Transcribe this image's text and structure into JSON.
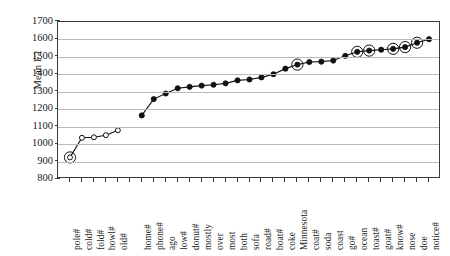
{
  "chart_data": {
    "type": "line",
    "title": "",
    "xlabel": "",
    "ylabel": "Mean F2",
    "ylim": [
      800,
      1700
    ],
    "ytick_labels": [
      "1700",
      "1600",
      "1500",
      "1400",
      "1300",
      "1200",
      "1100",
      "1000",
      "900",
      "800"
    ],
    "ytick_values": [
      1700,
      1600,
      1500,
      1400,
      1300,
      1200,
      1100,
      1000,
      900,
      800
    ],
    "grid": true,
    "legend": "none",
    "categories": [
      "pole#",
      "cold#",
      "fold#",
      "bowl#",
      "old#",
      "",
      "home#",
      "phone#",
      "ago",
      "low#",
      "donut#",
      "mostly",
      "over",
      "most",
      "both",
      "sofa",
      "road#",
      "boat#",
      "coke",
      "Minnesota",
      "coat#",
      "soda",
      "coast",
      "go#",
      "ocean",
      "toast#",
      "goat#",
      "know#",
      "nose",
      "doe",
      "notice#"
    ],
    "series": [
      {
        "name": "open-markers",
        "marker": "open-circle",
        "points": [
          {
            "category": "pole#",
            "value": 925,
            "highlighted": true
          },
          {
            "category": "cold#",
            "value": 1037,
            "highlighted": false
          },
          {
            "category": "fold#",
            "value": 1040,
            "highlighted": false
          },
          {
            "category": "bowl#",
            "value": 1052,
            "highlighted": false
          },
          {
            "category": "old#",
            "value": 1080,
            "highlighted": false
          }
        ]
      },
      {
        "name": "filled-markers",
        "marker": "filled-circle",
        "points": [
          {
            "category": "home#",
            "value": 1165,
            "highlighted": false
          },
          {
            "category": "phone#",
            "value": 1258,
            "highlighted": false
          },
          {
            "category": "ago",
            "value": 1290,
            "highlighted": false
          },
          {
            "category": "low#",
            "value": 1320,
            "highlighted": false
          },
          {
            "category": "donut#",
            "value": 1328,
            "highlighted": false
          },
          {
            "category": "mostly",
            "value": 1335,
            "highlighted": false
          },
          {
            "category": "over",
            "value": 1340,
            "highlighted": false
          },
          {
            "category": "most",
            "value": 1348,
            "highlighted": false
          },
          {
            "category": "both",
            "value": 1365,
            "highlighted": false
          },
          {
            "category": "sofa",
            "value": 1370,
            "highlighted": false
          },
          {
            "category": "road#",
            "value": 1382,
            "highlighted": false
          },
          {
            "category": "boat#",
            "value": 1400,
            "highlighted": false
          },
          {
            "category": "coke",
            "value": 1432,
            "highlighted": false
          },
          {
            "category": "Minnesota",
            "value": 1455,
            "highlighted": true
          },
          {
            "category": "coat#",
            "value": 1470,
            "highlighted": false
          },
          {
            "category": "soda",
            "value": 1472,
            "highlighted": false
          },
          {
            "category": "coast",
            "value": 1478,
            "highlighted": false
          },
          {
            "category": "go#",
            "value": 1505,
            "highlighted": false
          },
          {
            "category": "ocean",
            "value": 1528,
            "highlighted": true
          },
          {
            "category": "toast#",
            "value": 1535,
            "highlighted": true
          },
          {
            "category": "goat#",
            "value": 1540,
            "highlighted": false
          },
          {
            "category": "know#",
            "value": 1545,
            "highlighted": true
          },
          {
            "category": "nose",
            "value": 1555,
            "highlighted": true
          },
          {
            "category": "doe",
            "value": 1580,
            "highlighted": true
          },
          {
            "category": "notice#",
            "value": 1600,
            "highlighted": false
          }
        ]
      }
    ],
    "colors": {
      "line": "#111111",
      "marker_fill": "#111111",
      "marker_open_fill": "#ffffff",
      "gridline": "#b9b9b9",
      "axis": "#3a3a3a",
      "background": "#ffffff"
    }
  }
}
